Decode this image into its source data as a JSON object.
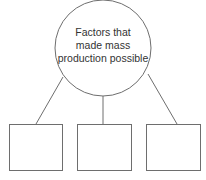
{
  "diagram": {
    "central_node": {
      "lines": [
        "Factors that",
        "made mass",
        "production possible"
      ]
    },
    "child_boxes": [
      {
        "text": ""
      },
      {
        "text": ""
      },
      {
        "text": ""
      }
    ],
    "stroke_color": "#6e6e6e"
  }
}
